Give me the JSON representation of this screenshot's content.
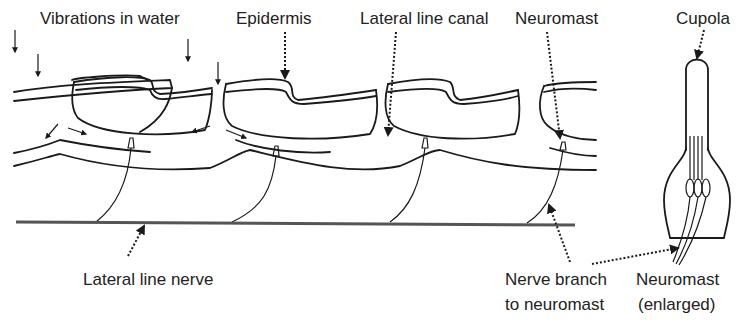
{
  "figure": {
    "labels": {
      "vibrations": "Vibrations in water",
      "epidermis": "Epidermis",
      "canal": "Lateral line canal",
      "neuromast": "Neuromast",
      "cupola": "Cupola",
      "nerve": "Lateral line nerve",
      "branch_line1": "Nerve branch",
      "branch_line2": "to neuromast",
      "enlarged_line1": "Neuromast",
      "enlarged_line2": "(enlarged)"
    },
    "colors": {
      "line": "#1a1a1a",
      "nerve": "#555555",
      "background": "#ffffff"
    }
  }
}
